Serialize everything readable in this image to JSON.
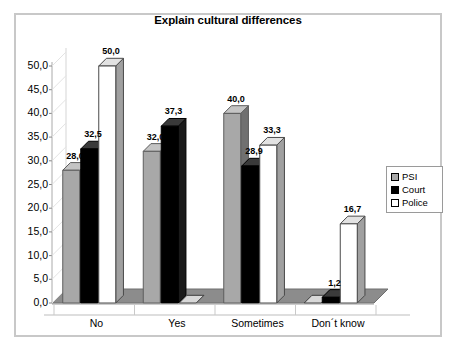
{
  "chart_data": {
    "type": "bar",
    "title": "Explain cultural differences",
    "xlabel": "",
    "ylabel": "",
    "categories": [
      "No",
      "Yes",
      "Sometimes",
      "Don´t know"
    ],
    "series": [
      {
        "name": "PSI",
        "color": "#a8a8a8",
        "values": [
          28.0,
          32.0,
          40.0,
          0.0
        ]
      },
      {
        "name": "Court",
        "color": "#000000",
        "values": [
          32.5,
          37.3,
          28.9,
          1.2
        ]
      },
      {
        "name": "Police",
        "color": "#ffffff",
        "values": [
          50.0,
          0.0,
          33.3,
          16.7
        ]
      }
    ],
    "value_labels": [
      [
        "28,0",
        "32,5",
        "50,0"
      ],
      [
        "32,0",
        "37,3",
        "0,0"
      ],
      [
        "40,0",
        "28,9",
        "33,3"
      ],
      [
        "0,0",
        "1,2",
        "16,7"
      ]
    ],
    "ylim": [
      0,
      50
    ],
    "ytick_values": [
      0,
      5,
      10,
      15,
      20,
      25,
      30,
      35,
      40,
      45,
      50
    ],
    "ytick_labels": [
      "0,0",
      "5,0",
      "10,0",
      "15,0",
      "20,0",
      "25,0",
      "30,0",
      "35,0",
      "40,0",
      "45,0",
      "50,0"
    ],
    "grid": false,
    "three_d": true,
    "legend_position": "right"
  },
  "legend": {
    "items": [
      {
        "label": "PSI",
        "swatch": "#a8a8a8"
      },
      {
        "label": "Court",
        "swatch": "#000000"
      },
      {
        "label": "Police",
        "swatch": "#ffffff"
      }
    ]
  },
  "colors": {
    "frame": "#c8c8c8",
    "axis": "#808080",
    "floor": "#8c8c8c",
    "floor_top": "#9a9a9a",
    "psi_front": "#a8a8a8",
    "psi_side": "#707070",
    "psi_top": "#c4c4c4",
    "court_front": "#000000",
    "court_side": "#1a1a1a",
    "police_front": "#ffffff",
    "police_side": "#a0a0a0",
    "police_top": "#e2e2e2"
  }
}
